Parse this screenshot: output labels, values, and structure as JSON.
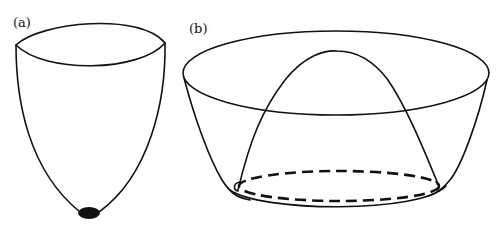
{
  "figure": {
    "panels": [
      {
        "label": "(a)",
        "description": "Narrow parabolic potential well with single minimum at the bottom",
        "minimum_marker": "filled-ellipse"
      },
      {
        "label": "(b)",
        "description": "Wide potential bowl with central hump (Mexican-hat) and a ring of degenerate minima",
        "minimum_marker": "dashed-ellipse"
      }
    ],
    "colors": {
      "line": "#111111",
      "background": "#ffffff"
    }
  }
}
